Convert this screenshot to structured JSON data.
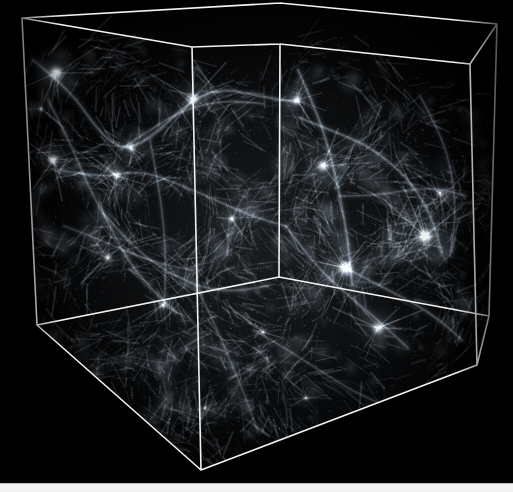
{
  "figure": {
    "title": "Cosmological N-body simulation volume",
    "background_color": "#000000",
    "wireframe_color": "#f2f2f2",
    "filament_color": "#d8e4ec",
    "page_strip_color": "#f3f3f3",
    "canvas": {
      "width": 513,
      "height": 492
    },
    "render_area": {
      "width": 513,
      "height": 483
    }
  },
  "chart_data": {
    "type": "scatter",
    "title": "Cosmological N-body simulation volume",
    "xlabel": "",
    "ylabel": "",
    "projection": "3d-perspective-cube",
    "cube": {
      "edge_color": "#f2f2f2",
      "edge_width": 1.6,
      "vertices": {
        "back_top_left": [
          22,
          18
        ],
        "back_top_right": [
          280,
          3
        ],
        "right_top_back": [
          497,
          24
        ],
        "front_top_left": [
          192,
          47
        ],
        "front_top_center": [
          280,
          44
        ],
        "right_top_front": [
          470,
          64
        ],
        "back_bottom_left": [
          37,
          325
        ],
        "front_bottom_left": [
          201,
          470
        ],
        "center_bottom": [
          279,
          277
        ],
        "right_bottom": [
          477,
          365
        ],
        "right_bottom_back": [
          489,
          316
        ]
      },
      "visible_faces": [
        "top",
        "left",
        "back",
        "bottom"
      ]
    },
    "structure": {
      "description": "filamentary large-scale structure: nodes, filaments, sheets and voids",
      "void_count_visible": 12,
      "bright_halo_count": 9,
      "intensity_range": [
        0.0,
        1.0
      ],
      "colormap": "grayscale"
    },
    "halos": [
      {
        "x": 56,
        "y": 73,
        "r": 7,
        "i": 0.95
      },
      {
        "x": 41,
        "y": 109,
        "r": 3,
        "i": 0.55
      },
      {
        "x": 53,
        "y": 160,
        "r": 5,
        "i": 0.85
      },
      {
        "x": 117,
        "y": 176,
        "r": 4,
        "i": 0.7
      },
      {
        "x": 131,
        "y": 148,
        "r": 4,
        "i": 0.62
      },
      {
        "x": 193,
        "y": 99,
        "r": 6,
        "i": 0.78
      },
      {
        "x": 297,
        "y": 100,
        "r": 5,
        "i": 0.72
      },
      {
        "x": 323,
        "y": 166,
        "r": 6,
        "i": 0.8
      },
      {
        "x": 345,
        "y": 268,
        "r": 7,
        "i": 0.9
      },
      {
        "x": 425,
        "y": 236,
        "r": 8,
        "i": 0.95
      },
      {
        "x": 378,
        "y": 328,
        "r": 6,
        "i": 0.82
      },
      {
        "x": 440,
        "y": 193,
        "r": 4,
        "i": 0.58
      },
      {
        "x": 232,
        "y": 219,
        "r": 4,
        "i": 0.6
      },
      {
        "x": 163,
        "y": 305,
        "r": 4,
        "i": 0.55
      },
      {
        "x": 108,
        "y": 258,
        "r": 4,
        "i": 0.58
      },
      {
        "x": 263,
        "y": 332,
        "r": 3,
        "i": 0.45
      },
      {
        "x": 306,
        "y": 398,
        "r": 3,
        "i": 0.4
      },
      {
        "x": 205,
        "y": 408,
        "r": 3,
        "i": 0.38
      }
    ],
    "filaments": [
      {
        "points": [
          [
            33,
            60
          ],
          [
            70,
            90
          ],
          [
            96,
            128
          ],
          [
            120,
            150
          ],
          [
            150,
            140
          ],
          [
            186,
            104
          ],
          [
            220,
            88
          ],
          [
            258,
            96
          ],
          [
            296,
            102
          ]
        ],
        "i": 0.5,
        "w": 2.4
      },
      {
        "points": [
          [
            48,
            100
          ],
          [
            70,
            142
          ],
          [
            88,
            186
          ],
          [
            108,
            222
          ],
          [
            126,
            258
          ],
          [
            150,
            288
          ],
          [
            176,
            312
          ]
        ],
        "i": 0.42,
        "w": 2.2
      },
      {
        "points": [
          [
            60,
            170
          ],
          [
            100,
            178
          ],
          [
            140,
            170
          ],
          [
            178,
            184
          ],
          [
            216,
            200
          ],
          [
            250,
            216
          ],
          [
            286,
            226
          ]
        ],
        "i": 0.45,
        "w": 2.0
      },
      {
        "points": [
          [
            104,
            214
          ],
          [
            132,
            246
          ],
          [
            164,
            270
          ],
          [
            196,
            286
          ],
          [
            230,
            292
          ],
          [
            268,
            286
          ]
        ],
        "i": 0.4,
        "w": 2.0
      },
      {
        "points": [
          [
            298,
            70
          ],
          [
            316,
            110
          ],
          [
            330,
            152
          ],
          [
            340,
            196
          ],
          [
            348,
            240
          ],
          [
            352,
            284
          ]
        ],
        "i": 0.52,
        "w": 2.4
      },
      {
        "points": [
          [
            300,
            118
          ],
          [
            336,
            132
          ],
          [
            372,
            148
          ],
          [
            406,
            176
          ],
          [
            430,
            212
          ],
          [
            442,
            252
          ]
        ],
        "i": 0.48,
        "w": 2.2
      },
      {
        "points": [
          [
            346,
            268
          ],
          [
            380,
            286
          ],
          [
            412,
            302
          ],
          [
            440,
            320
          ],
          [
            462,
            340
          ]
        ],
        "i": 0.46,
        "w": 2.1
      },
      {
        "points": [
          [
            340,
            196
          ],
          [
            372,
            196
          ],
          [
            406,
            190
          ],
          [
            438,
            188
          ],
          [
            466,
            196
          ]
        ],
        "i": 0.38,
        "w": 1.8
      },
      {
        "points": [
          [
            196,
            286
          ],
          [
            214,
            322
          ],
          [
            230,
            360
          ],
          [
            246,
            398
          ],
          [
            258,
            432
          ]
        ],
        "i": 0.34,
        "w": 1.8
      },
      {
        "points": [
          [
            286,
            226
          ],
          [
            312,
            262
          ],
          [
            344,
            292
          ],
          [
            378,
            320
          ],
          [
            408,
            348
          ]
        ],
        "i": 0.44,
        "w": 2.0
      },
      {
        "points": [
          [
            150,
            140
          ],
          [
            158,
            182
          ],
          [
            164,
            226
          ],
          [
            166,
            268
          ],
          [
            164,
            306
          ]
        ],
        "i": 0.36,
        "w": 1.8
      },
      {
        "points": [
          [
            120,
            150
          ],
          [
            152,
            128
          ],
          [
            188,
            108
          ],
          [
            226,
            100
          ],
          [
            264,
            104
          ]
        ],
        "i": 0.4,
        "w": 1.8
      },
      {
        "points": [
          [
            254,
            330
          ],
          [
            288,
            350
          ],
          [
            322,
            372
          ],
          [
            354,
            392
          ],
          [
            386,
            406
          ]
        ],
        "i": 0.32,
        "w": 1.7
      },
      {
        "points": [
          [
            64,
            226
          ],
          [
            96,
            238
          ],
          [
            128,
            252
          ],
          [
            160,
            264
          ],
          [
            192,
            270
          ]
        ],
        "i": 0.33,
        "w": 1.7
      },
      {
        "points": [
          [
            420,
            96
          ],
          [
            440,
            132
          ],
          [
            452,
            172
          ],
          [
            456,
            214
          ],
          [
            450,
            256
          ]
        ],
        "i": 0.36,
        "w": 1.8
      }
    ]
  }
}
